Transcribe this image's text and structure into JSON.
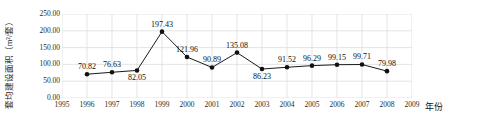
{
  "chart_data": {
    "type": "line",
    "title": "",
    "xlabel": "年份",
    "ylabel": "套均建设面积（m²/套）",
    "x": [
      1996,
      1997,
      1998,
      1999,
      2000,
      2001,
      2002,
      2003,
      2004,
      2005,
      2006,
      2007,
      2008
    ],
    "values": [
      70.82,
      76.63,
      82.05,
      197.43,
      121.96,
      90.89,
      135.08,
      86.23,
      91.52,
      96.29,
      99.15,
      99.71,
      79.98
    ],
    "value_labels": [
      "70.82",
      "76.63",
      "82.05",
      "197.43",
      "121.96",
      "90.89",
      "135.08",
      "86.23",
      "91.52",
      "96.29",
      "99.15",
      "99.71",
      "79.98"
    ],
    "label_positions": [
      "above",
      "above",
      "below",
      "above",
      "above",
      "above",
      "above",
      "below",
      "above",
      "above",
      "above",
      "above",
      "above"
    ],
    "xlim": [
      1995,
      2009
    ],
    "ylim": [
      0,
      250
    ],
    "x_ticks": [
      1995,
      1996,
      1997,
      1998,
      1999,
      2000,
      2001,
      2002,
      2003,
      2004,
      2005,
      2006,
      2007,
      2008,
      2009
    ],
    "x_tick_labels": [
      "1995",
      "1996",
      "1997",
      "1998",
      "1999",
      "2000",
      "2001",
      "2002",
      "2003",
      "2004",
      "2005",
      "2006",
      "2007",
      "2008",
      "2009"
    ],
    "y_ticks": [
      0,
      50,
      100,
      150,
      200,
      250
    ],
    "y_tick_labels": [
      "0.00",
      "50.00",
      "100.00",
      "150.00",
      "200.00",
      "250.00"
    ],
    "grid": true,
    "legend": "none",
    "series_color": "#1a1a1a",
    "marker": "circle",
    "marker_color": "#111111",
    "grid_color": "#d9d9d9"
  }
}
